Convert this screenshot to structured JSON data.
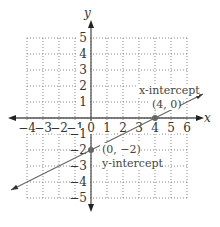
{
  "chart_data": {
    "type": "line",
    "title": "",
    "xlabel": "x",
    "ylabel": "y",
    "xlim": [
      -4,
      6
    ],
    "ylim": [
      -5,
      5
    ],
    "grid": true,
    "x_ticks": [
      "−4",
      "−3",
      "−2",
      "−1",
      "0",
      "1",
      "2",
      "3",
      "4",
      "5",
      "6"
    ],
    "y_ticks": [
      "5",
      "4",
      "3",
      "2",
      "1",
      "−1",
      "−2",
      "−3",
      "−4",
      "−5"
    ],
    "series": [
      {
        "name": "line",
        "equation": "y = 0.5x - 2",
        "x": [
          -5,
          0,
          4,
          7
        ],
        "y": [
          -4.5,
          -2,
          0,
          1.5
        ]
      }
    ],
    "points": [
      {
        "x": 4,
        "y": 0,
        "label": "(4, 0)",
        "annotation": "x-intercept"
      },
      {
        "x": 0,
        "y": -2,
        "label": "(0, −2)",
        "annotation": "y-intercept"
      }
    ],
    "annotations": [
      "x-intercept",
      "(4, 0)",
      "(0, −2)",
      "y-intercept"
    ]
  },
  "labels": {
    "x_axis": "x",
    "y_axis": "y",
    "x_intercept_title": "x-intercept",
    "x_intercept_point": "(4, 0)",
    "y_intercept_point": "(0, −2)",
    "y_intercept_title": "y-intercept"
  },
  "colors": {
    "axis": "#555555",
    "grid": "#888888",
    "line": "#666666",
    "point": "#666666"
  }
}
